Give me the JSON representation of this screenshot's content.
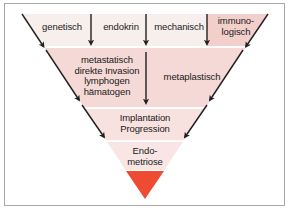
{
  "figure": {
    "type": "inverted-funnel-diagram",
    "frame_color": "#a8a8a8",
    "background": "#ffffff"
  },
  "colors": {
    "band_top": "#f7efec",
    "band_second": "#f4d9d6",
    "band_third": "#f7e2e0",
    "band_fourth": "#f9e6e4",
    "column_highlight": "#f3cfcc",
    "tip_red": "#ee4b32",
    "arrow": "#202020",
    "text": "#1a1a1a"
  },
  "inputs": [
    {
      "id": "genetisch",
      "label": "genetisch",
      "arrow": "down-arrow-genetisch"
    },
    {
      "id": "endokrin",
      "label": "endokrin",
      "arrow": "down-arrow-endokrin"
    },
    {
      "id": "mechanisch",
      "label": "mechanisch",
      "arrow": "down-arrow-mechanisch"
    },
    {
      "id": "immunologisch",
      "label_line1": "immuno-",
      "label_line2": "logisch",
      "arrow": "diagonal-arrow-right"
    }
  ],
  "stages": [
    {
      "id": "mechanismen-links",
      "lines": [
        "metastatisch",
        "direkte Invasion",
        "lymphogen",
        "hämatogen"
      ]
    },
    {
      "id": "mechanismen-rechts",
      "lines": [
        "metaplastisch"
      ]
    },
    {
      "id": "implantation-progression",
      "lines": [
        "Implantation",
        "Progression"
      ]
    },
    {
      "id": "endometriose",
      "lines": [
        "Endo-",
        "metriose"
      ]
    }
  ],
  "arrows": {
    "left_diagonal": "diagonal-arrow-left",
    "right_diagonal": "diagonal-arrow-right",
    "count_vertical": 3
  }
}
